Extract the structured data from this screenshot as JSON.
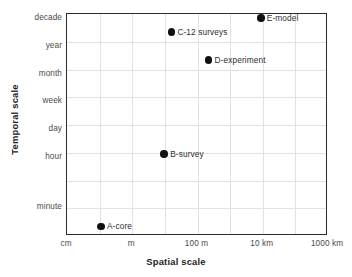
{
  "chart_data": {
    "type": "scatter",
    "title": "",
    "xlabel": "Spatial scale",
    "ylabel": "Temporal scale",
    "grid": true,
    "legend": false,
    "x_tick_labels": [
      "cm",
      "m",
      "100 m",
      "10 km",
      "1000 km"
    ],
    "y_tick_labels": [
      "decade",
      "year",
      "month",
      "week",
      "day",
      "hour",
      "minute"
    ],
    "xlim": [
      0,
      4
    ],
    "ylim": [
      0,
      8
    ],
    "points": [
      {
        "label": "A-core",
        "x_display": "between cm and m",
        "y_display": "below minute",
        "x": 0.52,
        "y": 0.35
      },
      {
        "label": "B-survey",
        "x_display": "near 100 m",
        "y_display": "just above hour",
        "x": 1.49,
        "y": 2.95
      },
      {
        "label": "C-12 surveys",
        "x_display": "near 100 m",
        "y_display": "between year and decade",
        "x": 1.6,
        "y": 7.35
      },
      {
        "label": "D-experiment",
        "x_display": "past 100 m",
        "y_display": "between month and year",
        "x": 2.17,
        "y": 6.35
      },
      {
        "label": "E-model",
        "x_display": "near 10 km",
        "y_display": "at decade",
        "x": 2.97,
        "y": 7.85
      }
    ],
    "marker_color": "#111111",
    "grid_color": "#e2e2e6",
    "frame_color": "#2b2b2b"
  }
}
